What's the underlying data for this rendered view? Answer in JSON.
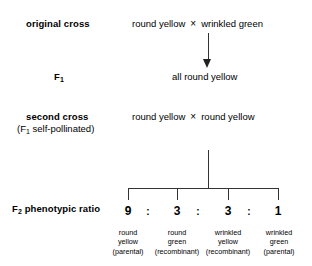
{
  "figure": {
    "line_color": "#333333"
  },
  "stages": {
    "original_cross": {
      "label": "original cross",
      "parent_a": "round yellow",
      "operator": "×",
      "parent_b": "wrinkled green"
    },
    "f1": {
      "label_main": "F",
      "label_sub": "1",
      "offspring": "all round yellow"
    },
    "second_cross": {
      "label": "second cross",
      "sub_prefix": "(F",
      "sub_sub": "1",
      "sub_suffix": " self-pollinated)",
      "parent_a": "round yellow",
      "operator": "×",
      "parent_b": "round yellow"
    },
    "f2": {
      "label_main": "F",
      "label_sub": "2",
      "label_rest": " phenotypic ratio"
    }
  },
  "ratio": {
    "separator": ":",
    "classes": [
      {
        "count": "9",
        "trait_1": "round",
        "trait_2": "yellow",
        "origin": "(parental)"
      },
      {
        "count": "3",
        "trait_1": "round",
        "trait_2": "green",
        "origin": "(recombinant)"
      },
      {
        "count": "3",
        "trait_1": "wrinkled",
        "trait_2": "yellow",
        "origin": "(recombinant)"
      },
      {
        "count": "1",
        "trait_1": "wrinkled",
        "trait_2": "green",
        "origin": "(parental)"
      }
    ]
  },
  "chart_data": {
    "type": "bar",
    "title": "F2 phenotypic ratio",
    "categories": [
      "round yellow (parental)",
      "round green (recombinant)",
      "wrinkled yellow (recombinant)",
      "wrinkled green (parental)"
    ],
    "values": [
      9,
      3,
      3,
      1
    ],
    "xlabel": "",
    "ylabel": "",
    "ylim": [
      0,
      9
    ],
    "legend": "none"
  }
}
